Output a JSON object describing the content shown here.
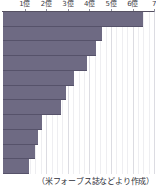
{
  "chart_data": {
    "type": "bar",
    "orientation": "horizontal",
    "title": "",
    "subtitle": "",
    "xlabel": "",
    "ylabel": "",
    "grid": true,
    "legend": null,
    "xlim": [
      0,
      7
    ],
    "unit_label": "億",
    "axis_ticks": [
      {
        "value": 1,
        "label": "1億"
      },
      {
        "value": 2,
        "label": "2億"
      },
      {
        "value": 3,
        "label": "3億"
      },
      {
        "value": 4,
        "label": "4億"
      },
      {
        "value": 5,
        "label": "5億"
      },
      {
        "value": 6,
        "label": "6億"
      },
      {
        "value": 7,
        "label": "7"
      }
    ],
    "categories": [
      "",
      "",
      "",
      "",
      "",
      "",
      "",
      "",
      "",
      "",
      ""
    ],
    "values": [
      6.5,
      4.6,
      4.3,
      3.9,
      3.3,
      2.9,
      2.7,
      1.8,
      1.6,
      1.5,
      1.2
    ],
    "bar_color": "#6e6a83",
    "background_color": "#ffffff",
    "gridline_color": "#dcdce2"
  },
  "caption": {
    "source_note": "（米フォーブス誌などより作成）"
  }
}
